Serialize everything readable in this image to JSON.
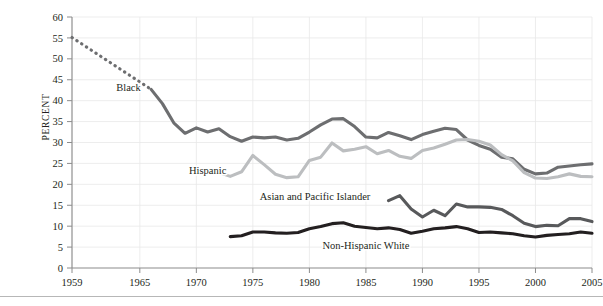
{
  "chart_data": {
    "type": "line",
    "title": "",
    "subtitle": "",
    "xlabel": "",
    "ylabel": "PERCENT",
    "xlim": [
      1959,
      2005
    ],
    "ylim": [
      0,
      60
    ],
    "grid": true,
    "legend_position": "inline-annotations",
    "x_ticks": [
      1959,
      1965,
      1970,
      1975,
      1980,
      1985,
      1990,
      1995,
      2000,
      2005
    ],
    "x_tick_labels": [
      "1959",
      "1965",
      "1970",
      "1975",
      "1980",
      "1985",
      "1990",
      "1995",
      "2000",
      "2005"
    ],
    "y_ticks": [
      0,
      5,
      10,
      15,
      20,
      25,
      30,
      35,
      40,
      45,
      50,
      55,
      60
    ],
    "y_tick_labels": [
      "0",
      "5",
      "10",
      "15",
      "20",
      "25",
      "30",
      "35",
      "40",
      "45",
      "50",
      "55",
      "60"
    ],
    "series": [
      {
        "name": "Black",
        "label": "Black",
        "color": "#6d6e70",
        "label_x": 1964.0,
        "label_y": 43.2,
        "dashed_segment": {
          "style": "dotted",
          "x": [
            1959,
            1966
          ],
          "y": [
            55.1,
            42.7
          ]
        },
        "x": [
          1966,
          1967,
          1968,
          1969,
          1970,
          1971,
          1972,
          1973,
          1974,
          1975,
          1976,
          1977,
          1978,
          1979,
          1980,
          1981,
          1982,
          1983,
          1984,
          1985,
          1986,
          1987,
          1988,
          1989,
          1990,
          1991,
          1992,
          1993,
          1994,
          1995,
          1996,
          1997,
          1998,
          1999,
          2000,
          2001,
          2002,
          2003,
          2004,
          2005
        ],
        "y": [
          42.7,
          39.3,
          34.7,
          32.2,
          33.5,
          32.5,
          33.3,
          31.4,
          30.3,
          31.3,
          31.1,
          31.3,
          30.6,
          31.0,
          32.5,
          34.2,
          35.6,
          35.7,
          33.8,
          31.3,
          31.1,
          32.4,
          31.6,
          30.7,
          31.9,
          32.7,
          33.4,
          33.1,
          30.6,
          29.3,
          28.4,
          26.5,
          26.1,
          23.6,
          22.5,
          22.7,
          24.1,
          24.4,
          24.7,
          24.9
        ]
      },
      {
        "name": "Hispanic",
        "label": "Hispanic",
        "color": "#bcbec0",
        "label_x": 1971.0,
        "label_y": 23.3,
        "x": [
          1972,
          1973,
          1974,
          1975,
          1976,
          1977,
          1978,
          1979,
          1980,
          1981,
          1982,
          1983,
          1984,
          1985,
          1986,
          1987,
          1988,
          1989,
          1990,
          1991,
          1992,
          1993,
          1994,
          1995,
          1996,
          1997,
          1998,
          1999,
          2000,
          2001,
          2002,
          2003,
          2004,
          2005
        ],
        "y": [
          22.8,
          21.9,
          23.0,
          26.9,
          24.7,
          22.4,
          21.6,
          21.8,
          25.7,
          26.5,
          29.9,
          28.0,
          28.4,
          29.0,
          27.3,
          28.1,
          26.7,
          26.2,
          28.1,
          28.7,
          29.6,
          30.6,
          30.7,
          30.3,
          29.4,
          27.1,
          25.6,
          22.8,
          21.5,
          21.4,
          21.8,
          22.5,
          21.9,
          21.8
        ]
      },
      {
        "name": "Asian and Pacific Islander",
        "label": "Asian and Pacific Islander",
        "color": "#58595b",
        "label_x": 1980.5,
        "label_y": 17.2,
        "x": [
          1987,
          1988,
          1989,
          1990,
          1991,
          1992,
          1993,
          1994,
          1995,
          1996,
          1997,
          1998,
          1999,
          2000,
          2001,
          2002,
          2003,
          2004,
          2005
        ],
        "y": [
          16.1,
          17.3,
          14.1,
          12.2,
          13.8,
          12.5,
          15.3,
          14.6,
          14.6,
          14.5,
          14.0,
          12.5,
          10.7,
          9.9,
          10.2,
          10.1,
          11.8,
          11.8,
          11.1
        ]
      },
      {
        "name": "Non-Hispanic White",
        "label": "Non-Hispanic White",
        "color": "#231f20",
        "label_x": 1985.0,
        "label_y": 5.4,
        "x": [
          1973,
          1974,
          1975,
          1976,
          1977,
          1978,
          1979,
          1980,
          1981,
          1982,
          1983,
          1984,
          1985,
          1986,
          1987,
          1988,
          1989,
          1990,
          1991,
          1992,
          1993,
          1994,
          1995,
          1996,
          1997,
          1998,
          1999,
          2000,
          2001,
          2002,
          2003,
          2004,
          2005
        ],
        "y": [
          7.5,
          7.7,
          8.6,
          8.6,
          8.4,
          8.3,
          8.5,
          9.4,
          9.9,
          10.6,
          10.8,
          10.0,
          9.7,
          9.4,
          9.6,
          9.2,
          8.3,
          8.8,
          9.4,
          9.6,
          9.9,
          9.4,
          8.5,
          8.6,
          8.4,
          8.2,
          7.7,
          7.4,
          7.8,
          8.0,
          8.2,
          8.6,
          8.3
        ]
      }
    ]
  }
}
